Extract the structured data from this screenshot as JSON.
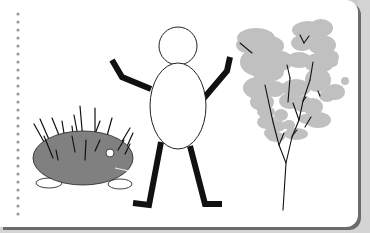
{
  "scene": {
    "description": "Simple clip-art illustration on a notebook page",
    "subjects": [
      "hedgehog",
      "stick-figure-person",
      "tree"
    ]
  },
  "colors": {
    "page": "#ffffff",
    "background": "#d4d4d4",
    "page_shadow": "#6b6b6b",
    "notebook_dots": "#9a9a9a",
    "hedgehog_body": "#808080",
    "tree_foliage": "#c0c0c0",
    "ink": "#111111"
  }
}
